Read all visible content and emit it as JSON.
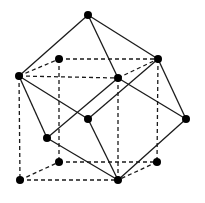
{
  "diagram": {
    "type": "3d-polyhedron-projection",
    "colors": {
      "line": "#1a1a1a",
      "vertex": "#000000",
      "background": "#ffffff"
    },
    "vertices": [
      {
        "id": "top",
        "x": 88,
        "y": 15
      },
      {
        "id": "btl",
        "x": 59,
        "y": 59
      },
      {
        "id": "btr",
        "x": 158,
        "y": 59
      },
      {
        "id": "ftl",
        "x": 19,
        "y": 76
      },
      {
        "id": "ftr",
        "x": 118,
        "y": 78
      },
      {
        "id": "center",
        "x": 88,
        "y": 119
      },
      {
        "id": "right",
        "x": 186,
        "y": 119
      },
      {
        "id": "leftmid",
        "x": 47,
        "y": 138
      },
      {
        "id": "bbl",
        "x": 59,
        "y": 162
      },
      {
        "id": "bbr",
        "x": 157,
        "y": 162
      },
      {
        "id": "fbl",
        "x": 20,
        "y": 180
      },
      {
        "id": "fbr",
        "x": 118,
        "y": 180
      }
    ],
    "solid_edges": [
      [
        "top",
        "ftl"
      ],
      [
        "top",
        "ftr"
      ],
      [
        "top",
        "btr"
      ],
      [
        "ftl",
        "center"
      ],
      [
        "ftl",
        "leftmid"
      ],
      [
        "ftr",
        "leftmid"
      ],
      [
        "ftr",
        "right"
      ],
      [
        "btr",
        "center"
      ],
      [
        "btr",
        "right"
      ],
      [
        "center",
        "fbr"
      ],
      [
        "leftmid",
        "fbr"
      ],
      [
        "right",
        "fbr"
      ]
    ],
    "dashed_edges": [
      [
        "ftl",
        "btl"
      ],
      [
        "btl",
        "btr"
      ],
      [
        "ftl",
        "ftr"
      ],
      [
        "ftr",
        "btr"
      ],
      [
        "ftl",
        "fbl"
      ],
      [
        "btl",
        "bbl"
      ],
      [
        "ftr",
        "fbr"
      ],
      [
        "btr",
        "bbr"
      ],
      [
        "fbl",
        "bbl"
      ],
      [
        "bbl",
        "bbr"
      ],
      [
        "fbl",
        "fbr"
      ],
      [
        "bbr",
        "fbr"
      ]
    ]
  }
}
